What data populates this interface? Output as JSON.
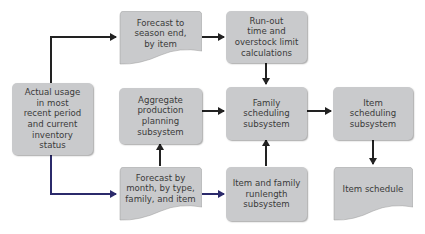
{
  "diagram": {
    "type": "flowchart",
    "colors": {
      "box_fill": "#c9cacc",
      "text": "#3a3a3a",
      "arrow": "#222222",
      "arrow_blue": "#2b2a6b"
    },
    "nodes": {
      "actual_usage": {
        "label": "Actual usage\nin most\nrecent period\nand current\ninventory\nstatus",
        "shape": "rounded-rect"
      },
      "forecast_season": {
        "label": "Forecast to\nseason end,\nby item",
        "shape": "document"
      },
      "runout": {
        "label": "Run-out\ntime and\noverstock limit\ncalculations",
        "shape": "rounded-rect"
      },
      "aggregate": {
        "label": "Aggregate\nproduction\nplanning\nsubsystem",
        "shape": "rounded-rect"
      },
      "family_sched": {
        "label": "Family\nscheduling\nsubsystem",
        "shape": "rounded-rect"
      },
      "item_sched": {
        "label": "Item\nscheduling\nsubsystem",
        "shape": "rounded-rect"
      },
      "forecast_month": {
        "label": "Forecast by\nmonth, by type,\nfamily, and item",
        "shape": "document"
      },
      "runlength": {
        "label": "Item and family\nrunlength\nsubsystem",
        "shape": "rounded-rect"
      },
      "item_schedule": {
        "label": "Item schedule",
        "shape": "document"
      }
    },
    "edges": [
      {
        "from": "Actual usage in most recent period and current inventory status",
        "to": "Forecast to season end, by item"
      },
      {
        "from": "Actual usage in most recent period and current inventory status",
        "to": "Forecast by month, by type, family, and item"
      },
      {
        "from": "Forecast to season end, by item",
        "to": "Run-out time and overstock limit calculations"
      },
      {
        "from": "Run-out time and overstock limit calculations",
        "to": "Family scheduling subsystem"
      },
      {
        "from": "Aggregate production planning subsystem",
        "to": "Family scheduling subsystem"
      },
      {
        "from": "Forecast by month, by type, family, and item",
        "to": "Aggregate production planning subsystem"
      },
      {
        "from": "Forecast by month, by type, family, and item",
        "to": "Item and family runlength subsystem"
      },
      {
        "from": "Item and family runlength subsystem",
        "to": "Family scheduling subsystem"
      },
      {
        "from": "Family scheduling subsystem",
        "to": "Item scheduling subsystem"
      },
      {
        "from": "Item scheduling subsystem",
        "to": "Item schedule"
      }
    ]
  }
}
